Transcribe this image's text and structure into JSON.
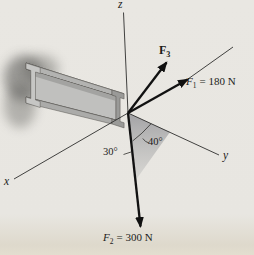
{
  "figure_type": "3D force diagram (I-beam with concurrent forces at its end)",
  "axes": {
    "z": "z",
    "x": "x",
    "y": "y"
  },
  "forces": {
    "f1": {
      "symbol": "F",
      "subscript": "1",
      "equals": "= 180 N"
    },
    "f2": {
      "symbol": "F",
      "subscript": "2",
      "equals": "= 300 N"
    },
    "f3": {
      "symbol": "F",
      "subscript": "3"
    }
  },
  "angles": {
    "angle_from_y_axis": "40°",
    "angle_from_vertical": "30°"
  },
  "colors": {
    "background": "#e8e6e1",
    "ink": "#1c1c1a",
    "beam_top": "#d6d6d4",
    "beam_front": "#b3b3b1",
    "beam_shadow": "#8e8e8c",
    "plane_shade": "#9b9b99"
  }
}
